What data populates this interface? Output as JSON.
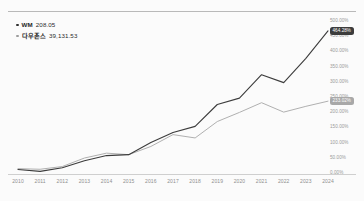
{
  "chart_data": {
    "type": "line",
    "title": "",
    "subtitle": "",
    "xlabel": "",
    "ylabel": "",
    "grid": false,
    "legend_position": "top-left",
    "x": [
      2010,
      2011,
      2012,
      2013,
      2014,
      2015,
      2016,
      2017,
      2018,
      2019,
      2020,
      2021,
      2022,
      2023,
      2024
    ],
    "categories": [
      "2010",
      "2011",
      "2012",
      "2013",
      "2014",
      "2015",
      "2016",
      "2017",
      "2018",
      "2019",
      "2020",
      "2021",
      "2022",
      "2023",
      "2024"
    ],
    "ylim": [
      0,
      500
    ],
    "ytick_values": [
      0,
      50,
      100,
      150,
      200,
      250,
      300,
      350,
      400,
      450,
      500
    ],
    "ytick_labels": [
      "0.00%",
      "50.00%",
      "100.00%",
      "150.00%",
      "200.00%",
      "250.00%",
      "300.00%",
      "350.00%",
      "400.00%",
      "450.00%",
      "500.00%"
    ],
    "series": [
      {
        "name": "WM",
        "color": "#3c3c3c",
        "end_label": "464.28%",
        "values": [
          8,
          2,
          14,
          37,
          54,
          57,
          97,
          130,
          150,
          222,
          243,
          320,
          294,
          374,
          464
        ]
      },
      {
        "name": "다우존스",
        "color": "#b0b0b0",
        "end_label": "233.02%",
        "values": [
          11,
          9,
          18,
          46,
          62,
          57,
          84,
          123,
          112,
          166,
          196,
          228,
          197,
          216,
          233
        ]
      }
    ]
  },
  "legend": {
    "items": [
      {
        "marker": "legend-dot",
        "name": "WM",
        "value": "208.05",
        "color": "#2f2f2f"
      },
      {
        "marker": "legend-dot",
        "name": "다우존스",
        "value": "39,131.53",
        "color": "#9c9c9c"
      }
    ]
  },
  "axis": {
    "y_labels": [
      "500.00%",
      "450.00%",
      "400.00%",
      "350.00%",
      "300.00%",
      "250.00%",
      "200.00%",
      "150.00%",
      "100.00%",
      "50.00%",
      "0.00%"
    ],
    "x_labels": [
      "2010",
      "2011",
      "2012",
      "2013",
      "2014",
      "2015",
      "2016",
      "2017",
      "2018",
      "2019",
      "2020",
      "2021",
      "2022",
      "2023",
      "2024"
    ]
  },
  "badges": [
    {
      "label": "464.28%",
      "color": "#3c3c3c"
    },
    {
      "label": "233.02%",
      "color": "#a8a8a8"
    }
  ],
  "colors": {
    "background": "#fbfbfb",
    "series_primary": "#3c3c3c",
    "series_secondary": "#b0b0b0",
    "axis_text": "#9a9a9a",
    "rule": "#b9b9b9"
  }
}
